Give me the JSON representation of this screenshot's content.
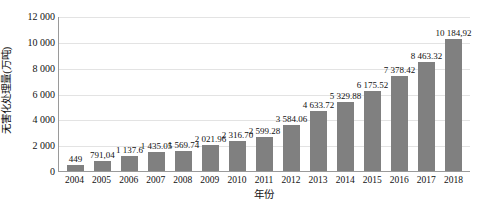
{
  "chart_data": {
    "type": "bar",
    "title": "",
    "subtitle": "",
    "xlabel": "年份",
    "ylabel": "无害化处理量(万吨)",
    "categories": [
      "2004",
      "2005",
      "2006",
      "2007",
      "2008",
      "2009",
      "2010",
      "2011",
      "2012",
      "2013",
      "2014",
      "2015",
      "2016",
      "2017",
      "2018"
    ],
    "values": [
      449,
      791.04,
      1137.6,
      1435.05,
      1569.74,
      2021.96,
      2316.7,
      2599.28,
      3584.06,
      4633.72,
      5329.88,
      6175.52,
      7378.42,
      8463.32,
      10184.92
    ],
    "value_labels": [
      "449",
      "791,04",
      "1 137.6",
      "1 435.05",
      "1 569.74",
      "2 021.96",
      "2 316.70",
      "2 599.28",
      "3 584.06",
      "4 633.72",
      "5 329.88",
      "6 175.52",
      "7 378.42",
      "8 463.32",
      "10 184,92"
    ],
    "ylim": [
      0,
      12000
    ],
    "ytick_values": [
      0,
      2000,
      4000,
      6000,
      8000,
      10000,
      12000
    ],
    "ytick_labels": [
      "0",
      "2 000",
      "4 000",
      "6 000",
      "8 000",
      "10 000",
      "12 000"
    ],
    "grid": true,
    "legend": false,
    "series": [
      {
        "name": "无害化处理量",
        "color": "#808080",
        "values": [
          449,
          791.04,
          1137.6,
          1435.05,
          1569.74,
          2021.96,
          2316.7,
          2599.28,
          3584.06,
          4633.72,
          5329.88,
          6175.52,
          7378.42,
          8463.32,
          10184.92
        ]
      }
    ],
    "colors": {
      "bar": "#808080",
      "gridline": "#e3e3e3",
      "axis": "#9a9a9a",
      "text": "#111111",
      "background": "#ffffff"
    }
  }
}
